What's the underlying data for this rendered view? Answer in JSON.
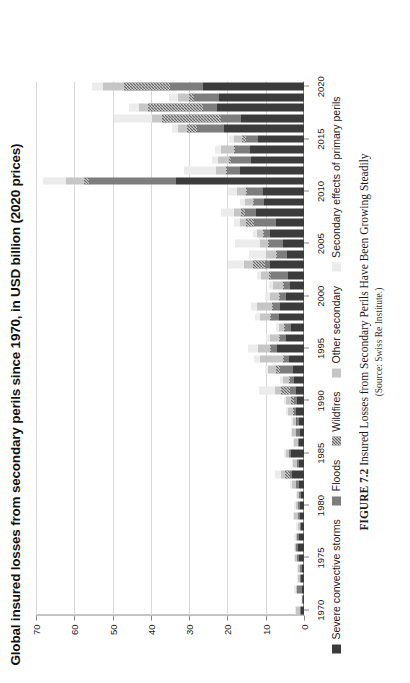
{
  "figure": {
    "title": "Global insured losses from secondary perils since 1970, in USD billion (2020 prices)",
    "caption_number": "FIGURE 7.2",
    "caption_text": "Insured Losses from Secondary Perils Have Been Growing Steadily",
    "caption_source": "(Source: Swiss Re Institute.)"
  },
  "legend": {
    "position": "bottom",
    "items": [
      {
        "label": "Severe convective storms",
        "swatch": "severe-convective-storms-swatch",
        "color": "#3b3b3b"
      },
      {
        "label": "Floods",
        "swatch": "floods-swatch",
        "color": "#7d7d7d"
      },
      {
        "label": "Wildfires",
        "swatch": "wildfires-swatch",
        "color": "#6b6b6b"
      },
      {
        "label": "Other secondary",
        "swatch": "other-secondary-swatch",
        "color": "#c6c6c6"
      },
      {
        "label": "Secondary effects of primary perils",
        "swatch": "secondary-effects-swatch",
        "color": "#ececec"
      }
    ]
  },
  "chart_data": {
    "type": "bar",
    "orientation": "horizontal",
    "stacked": true,
    "title": "Global insured losses from secondary perils since 1970, in USD billion (2020 prices)",
    "xlabel": "",
    "ylabel": "USD billion (2020 prices)",
    "value_axis_ticks": [
      0,
      10,
      20,
      30,
      40,
      50,
      60,
      70
    ],
    "value_axis_tick_labels": [
      "0",
      "10",
      "20",
      "30",
      "40",
      "50",
      "60",
      "70"
    ],
    "ylim": [
      0,
      70
    ],
    "grid": true,
    "category_axis_tick_labels": [
      "1970",
      "1975",
      "1980",
      "1985",
      "1990",
      "1995",
      "2000",
      "2005",
      "2010",
      "2015",
      "2020"
    ],
    "categories": [
      "1970",
      "1971",
      "1972",
      "1973",
      "1974",
      "1975",
      "1976",
      "1977",
      "1978",
      "1979",
      "1980",
      "1981",
      "1982",
      "1983",
      "1984",
      "1985",
      "1986",
      "1987",
      "1988",
      "1989",
      "1990",
      "1991",
      "1992",
      "1993",
      "1994",
      "1995",
      "1996",
      "1997",
      "1998",
      "1999",
      "2000",
      "2001",
      "2002",
      "2003",
      "2004",
      "2005",
      "2006",
      "2007",
      "2008",
      "2009",
      "2010",
      "2011",
      "2012",
      "2013",
      "2014",
      "2015",
      "2016",
      "2017",
      "2018",
      "2019",
      "2020"
    ],
    "series": [
      {
        "name": "Severe convective storms",
        "color": "#3b3b3b",
        "values": [
          0.9,
          0.3,
          0.6,
          0.8,
          0.6,
          1.4,
          1.7,
          1.3,
          0.7,
          1.0,
          1.0,
          0.9,
          1.3,
          3.2,
          1.4,
          3.3,
          1.2,
          1.1,
          1.4,
          2.1,
          1.8,
          2.1,
          2.6,
          2.9,
          3.9,
          7.0,
          4.6,
          3.4,
          6.6,
          6.2,
          4.8,
          3.6,
          4.3,
          8.9,
          4.4,
          5.5,
          8.8,
          7.2,
          12.5,
          10.5,
          10.8,
          33.5,
          16.6,
          13.8,
          14.0,
          12.1,
          21.0,
          16.4,
          22.6,
          22.3,
          26.5
        ]
      },
      {
        "name": "Floods",
        "color": "#7d7d7d",
        "values": [
          0.2,
          0.2,
          1.2,
          0.3,
          0.4,
          0.5,
          0.3,
          0.5,
          0.4,
          0.6,
          0.5,
          0.4,
          0.7,
          0.5,
          0.5,
          0.5,
          0.4,
          1.0,
          0.6,
          0.6,
          0.9,
          1.6,
          1.1,
          3.3,
          1.2,
          1.7,
          1.7,
          1.5,
          2.0,
          2.0,
          1.6,
          1.7,
          4.3,
          1.3,
          2.6,
          3.6,
          1.6,
          5.8,
          2.9,
          2.6,
          4.0,
          22.7,
          3.5,
          5.4,
          4.0,
          3.0,
          7.0,
          5.4,
          3.9,
          6.4,
          8.4
        ]
      },
      {
        "name": "Wildfires",
        "color": "#6b6b6b",
        "values": [
          0.0,
          0.0,
          0.0,
          0.0,
          0.0,
          0.0,
          0.0,
          0.0,
          0.0,
          0.0,
          0.0,
          0.0,
          0.0,
          1.2,
          0.0,
          0.0,
          0.0,
          0.0,
          0.2,
          0.2,
          0.7,
          2.3,
          0.2,
          1.0,
          0.3,
          0.3,
          0.2,
          0.2,
          0.2,
          0.2,
          0.2,
          0.3,
          0.6,
          3.0,
          0.2,
          0.4,
          0.3,
          2.2,
          1.0,
          0.3,
          0.3,
          1.3,
          0.4,
          0.3,
          0.4,
          1.0,
          2.5,
          15.4,
          14.2,
          1.4,
          12.0
        ]
      },
      {
        "name": "Other secondary",
        "color": "#c6c6c6",
        "values": [
          1.0,
          0.2,
          0.4,
          0.5,
          0.6,
          0.5,
          0.4,
          0.4,
          0.6,
          0.9,
          0.7,
          0.6,
          1.2,
          1.2,
          0.9,
          0.9,
          1.0,
          1.0,
          0.8,
          1.2,
          1.3,
          1.5,
          1.7,
          2.1,
          6.0,
          3.0,
          2.4,
          1.5,
          2.6,
          3.9,
          2.3,
          2.4,
          2.1,
          2.5,
          2.6,
          2.1,
          1.6,
          1.6,
          2.0,
          2.0,
          2.3,
          4.6,
          2.6,
          3.0,
          3.4,
          2.2,
          2.4,
          2.6,
          2.4,
          2.8,
          5.5
        ]
      },
      {
        "name": "Secondary effects of primary perils",
        "color": "#ececec",
        "values": [
          0.3,
          0.2,
          0.3,
          0.3,
          0.3,
          0.3,
          0.2,
          0.3,
          0.3,
          0.4,
          0.4,
          0.3,
          0.5,
          1.6,
          0.4,
          0.4,
          0.4,
          0.4,
          0.4,
          0.5,
          0.5,
          4.3,
          0.6,
          0.8,
          1.7,
          2.6,
          1.0,
          0.7,
          1.3,
          1.6,
          1.3,
          1.1,
          1.0,
          4.2,
          4.6,
          6.5,
          1.0,
          1.4,
          3.3,
          1.2,
          2.4,
          6.1,
          8.2,
          1.6,
          1.4,
          1.3,
          1.6,
          9.9,
          2.5,
          2.4,
          3.0
        ]
      }
    ]
  }
}
